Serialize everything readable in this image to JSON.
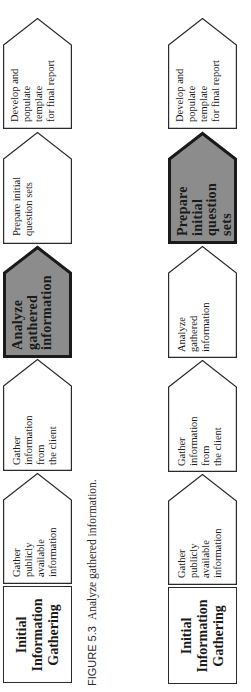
{
  "caption": {
    "figure_number": "FIGURE 5.3",
    "text": "Analyze gathered information."
  },
  "colors": {
    "background": "#ffffff",
    "shape_fill": "#ffffff",
    "shape_stroke": "#2a2a2a",
    "highlight_fill": "#8c8c8c",
    "highlight_stroke": "#1a1a1a"
  },
  "diagrams": [
    {
      "id": "left",
      "title": "Initial\nInformation\nGathering",
      "steps": [
        {
          "label": "Gather publicly\navailable\ninformation",
          "highlighted": false
        },
        {
          "label": "Gather\ninformation from\nthe client",
          "highlighted": false
        },
        {
          "label": "Analyze\ngathered\ninformation",
          "highlighted": true
        },
        {
          "label": "Prepare initial\nquestion sets",
          "highlighted": false
        },
        {
          "label": "Develop and\npopulate template\nfor final report",
          "highlighted": false
        }
      ]
    },
    {
      "id": "right",
      "title": "Initial\nInformation\nGathering",
      "steps": [
        {
          "label": "Gather publicly\navailable\ninformation",
          "highlighted": false
        },
        {
          "label": "Gather\ninformation from\nthe client",
          "highlighted": false
        },
        {
          "label": "Analyze gathered\ninformation",
          "highlighted": false
        },
        {
          "label": "Prepare\ninitial\nquestion sets",
          "highlighted": true
        },
        {
          "label": "Develop and\npopulate template\nfor final report",
          "highlighted": false
        }
      ]
    }
  ]
}
